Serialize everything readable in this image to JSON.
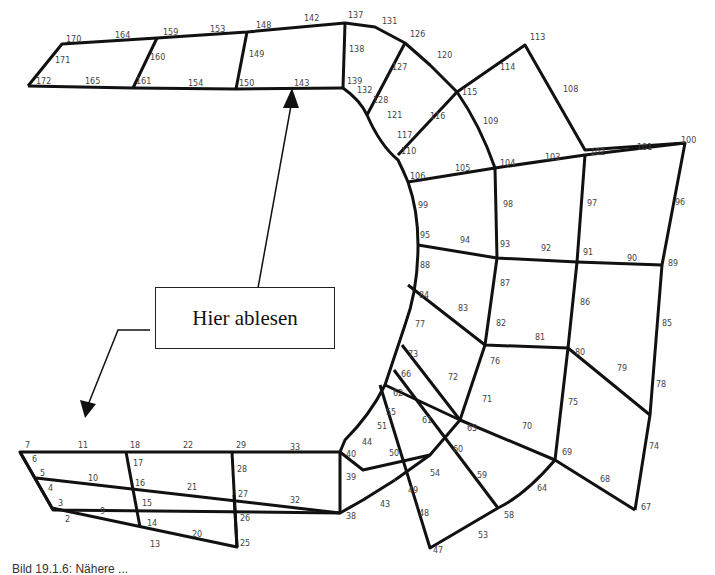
{
  "figure": {
    "callout_label": "Hier ablesen",
    "caption": "Bild 19.1.6: Nähere ...",
    "line_color": "#111111",
    "label_color": "#444444"
  },
  "mesh": {
    "upper_arm_labels": [
      "170",
      "164",
      "159",
      "153",
      "148",
      "142",
      "137",
      "131",
      "126",
      "120",
      "171",
      "160",
      "149",
      "138",
      "127",
      "172",
      "165",
      "161",
      "154",
      "150",
      "143",
      "139",
      "132",
      "128",
      "121",
      "116",
      "115",
      "114",
      "113",
      "108",
      "117",
      "110",
      "109",
      "106",
      "105",
      "104",
      "103",
      "102",
      "101",
      "100"
    ],
    "right_block_labels": [
      "99",
      "98",
      "97",
      "96",
      "95",
      "94",
      "93",
      "92",
      "91",
      "90",
      "89",
      "88",
      "87",
      "86",
      "85",
      "84",
      "83",
      "82",
      "81",
      "80",
      "79",
      "78",
      "77",
      "76",
      "75",
      "74",
      "73",
      "72",
      "71",
      "70",
      "69",
      "68",
      "67"
    ],
    "lower_arm_labels": [
      "66",
      "62",
      "55",
      "51",
      "44",
      "40",
      "39",
      "38",
      "43",
      "49",
      "50",
      "54",
      "60",
      "61",
      "65",
      "59",
      "58",
      "64",
      "48",
      "53",
      "47",
      "7",
      "11",
      "18",
      "22",
      "29",
      "33",
      "6",
      "5",
      "10",
      "17",
      "16",
      "21",
      "28",
      "27",
      "32",
      "4",
      "3",
      "9",
      "15",
      "14",
      "20",
      "2",
      "13",
      "26",
      "25"
    ]
  }
}
